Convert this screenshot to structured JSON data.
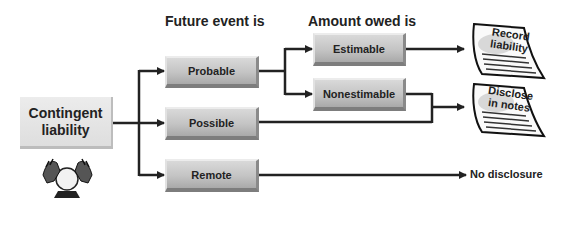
{
  "headers": {
    "future_event": "Future event is",
    "amount_owed": "Amount owed is"
  },
  "root": {
    "line1": "Contingent",
    "line2": "liability",
    "icon": "crystal-ball-icon"
  },
  "likelihood": [
    {
      "label": "Probable"
    },
    {
      "label": "Possible"
    },
    {
      "label": "Remote"
    }
  ],
  "estimability": [
    {
      "label": "Estimable"
    },
    {
      "label": "Nonestimable"
    }
  ],
  "outcomes": {
    "record": {
      "line1": "Record",
      "line2": "liability"
    },
    "disclose": {
      "line1": "Disclose",
      "line2": "in notes"
    },
    "none": "No disclosure"
  },
  "colors": {
    "line": "#222222",
    "box": "#c4c4c4",
    "root": "#e4e4e4"
  }
}
